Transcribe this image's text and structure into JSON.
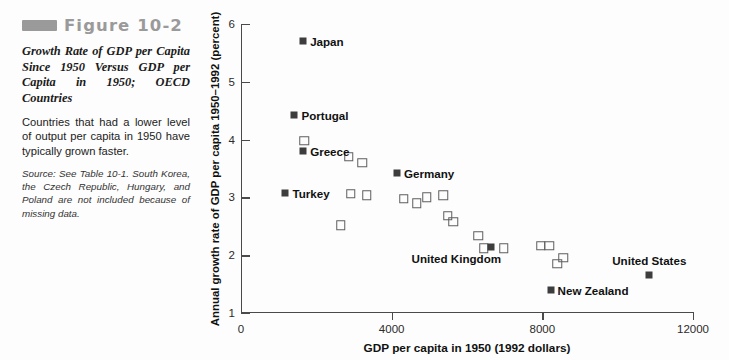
{
  "figure": {
    "number": "Figure 10-2",
    "title": "Growth Rate of GDP per Capita Since 1950 Versus GDP per Capita in 1950; OECD Countries",
    "description": "Countries that had a lower level of output per capita in 1950 have typically grown faster.",
    "source": "Source: See Table 10-1. South Korea, the Czech Republic, Hungary, and Poland are not included because of missing data.",
    "bar_color": "#9a9a9a"
  },
  "chart_data": {
    "type": "scatter",
    "title": "Growth Rate of GDP per Capita Since 1950 Versus GDP per Capita in 1950; OECD Countries",
    "xlabel": "GDP per capita in 1950 (1992 dollars)",
    "ylabel": "Annual growth rate of GDP per capita 1950–1992 (percent)",
    "xlim": [
      0,
      12000
    ],
    "ylim": [
      1,
      6
    ],
    "xticks": [
      0,
      4000,
      8000,
      12000
    ],
    "xticklabels": [
      "0",
      "4000",
      "8000",
      "12000"
    ],
    "yticks": [
      1,
      2,
      3,
      4,
      5,
      6
    ],
    "yticklabels": [
      "1",
      "2",
      "3",
      "4",
      "5",
      "6"
    ],
    "grid": false,
    "legend": "none",
    "marker_filled_color": "#3d3d3d",
    "marker_open_color": "#5e5e5e",
    "labeled_points": [
      {
        "label": "Japan",
        "x": 1650,
        "y": 5.7,
        "label_pos": "right"
      },
      {
        "label": "Portugal",
        "x": 1420,
        "y": 4.42,
        "label_pos": "right"
      },
      {
        "label": "Greece",
        "x": 1650,
        "y": 3.8,
        "label_pos": "right"
      },
      {
        "label": "Turkey",
        "x": 1180,
        "y": 3.08,
        "label_pos": "right"
      },
      {
        "label": "Germany",
        "x": 4140,
        "y": 3.42,
        "label_pos": "right"
      },
      {
        "label": "United Kingdom",
        "x": 6640,
        "y": 2.14,
        "label_pos": "below-left"
      },
      {
        "label": "New Zealand",
        "x": 8220,
        "y": 1.4,
        "label_pos": "right"
      },
      {
        "label": "United States",
        "x": 10840,
        "y": 1.65,
        "label_pos": "above"
      }
    ],
    "unlabeled_points": [
      {
        "x": 1680,
        "y": 3.98
      },
      {
        "x": 2860,
        "y": 3.7
      },
      {
        "x": 3220,
        "y": 3.6
      },
      {
        "x": 2910,
        "y": 3.06
      },
      {
        "x": 3340,
        "y": 3.04
      },
      {
        "x": 2650,
        "y": 2.52
      },
      {
        "x": 4320,
        "y": 2.98
      },
      {
        "x": 4660,
        "y": 2.9
      },
      {
        "x": 4930,
        "y": 3.0
      },
      {
        "x": 5370,
        "y": 3.04
      },
      {
        "x": 5490,
        "y": 2.68
      },
      {
        "x": 5630,
        "y": 2.58
      },
      {
        "x": 6300,
        "y": 2.34
      },
      {
        "x": 6440,
        "y": 2.12
      },
      {
        "x": 6980,
        "y": 2.12
      },
      {
        "x": 7960,
        "y": 2.16
      },
      {
        "x": 8180,
        "y": 2.16
      },
      {
        "x": 8560,
        "y": 1.96
      },
      {
        "x": 8400,
        "y": 1.85
      }
    ]
  }
}
